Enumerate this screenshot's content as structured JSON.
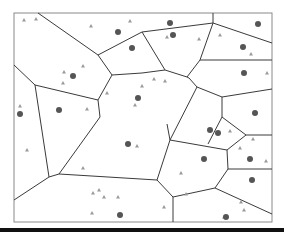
{
  "diagram": {
    "type": "voronoi",
    "frame": {
      "x": 14,
      "y": 13,
      "width": 258,
      "height": 209
    },
    "colors": {
      "edge": "#3a3a3a",
      "frame": "#8a8a8a",
      "site": "#555555",
      "marker": "#9a9a9a",
      "bar": "#111111"
    },
    "edges": [
      [
        38,
        13,
        98,
        55
      ],
      [
        98,
        55,
        112,
        75
      ],
      [
        98,
        55,
        140,
        33
      ],
      [
        140,
        33,
        142,
        32
      ],
      [
        14,
        65,
        35,
        85
      ],
      [
        35,
        85,
        98,
        100
      ],
      [
        98,
        100,
        112,
        75
      ],
      [
        112,
        75,
        142,
        73
      ],
      [
        35,
        85,
        49,
        177
      ],
      [
        49,
        177,
        14,
        200
      ],
      [
        49,
        177,
        59,
        174
      ],
      [
        59,
        174,
        100,
        117
      ],
      [
        100,
        117,
        98,
        100
      ],
      [
        59,
        174,
        157,
        180
      ],
      [
        142,
        32,
        213,
        23
      ],
      [
        213,
        13,
        213,
        23
      ],
      [
        213,
        23,
        272,
        43
      ],
      [
        213,
        23,
        200,
        60
      ],
      [
        200,
        60,
        187,
        77
      ],
      [
        187,
        77,
        165,
        70
      ],
      [
        165,
        70,
        142,
        32
      ],
      [
        187,
        77,
        189,
        78
      ],
      [
        189,
        78,
        197,
        87
      ],
      [
        197,
        87,
        222,
        97
      ],
      [
        222,
        97,
        272,
        89
      ],
      [
        200,
        60,
        272,
        60
      ],
      [
        142,
        73,
        165,
        70
      ],
      [
        197,
        87,
        170,
        140
      ],
      [
        170,
        140,
        167,
        124
      ],
      [
        170,
        140,
        227,
        150
      ],
      [
        227,
        150,
        246,
        135
      ],
      [
        246,
        135,
        272,
        135
      ],
      [
        246,
        135,
        222,
        117
      ],
      [
        222,
        117,
        222,
        97
      ],
      [
        208,
        144,
        222,
        117
      ],
      [
        227,
        150,
        228,
        169
      ],
      [
        228,
        169,
        272,
        169
      ],
      [
        228,
        169,
        215,
        188
      ],
      [
        215,
        188,
        272,
        214
      ],
      [
        215,
        188,
        173,
        197
      ],
      [
        173,
        197,
        173,
        222
      ],
      [
        173,
        197,
        157,
        180
      ],
      [
        157,
        180,
        170,
        140
      ]
    ],
    "sites": [
      [
        118,
        32
      ],
      [
        132,
        48
      ],
      [
        73,
        76
      ],
      [
        138,
        98
      ],
      [
        20,
        114
      ],
      [
        59,
        110
      ],
      [
        128,
        144
      ],
      [
        120,
        215
      ],
      [
        170,
        23
      ],
      [
        173,
        35
      ],
      [
        258,
        24
      ],
      [
        243,
        47
      ],
      [
        244,
        73
      ],
      [
        255,
        113
      ],
      [
        210,
        130
      ],
      [
        218,
        133
      ],
      [
        204,
        159
      ],
      [
        250,
        159
      ],
      [
        252,
        180
      ],
      [
        226,
        217
      ]
    ],
    "markers": [
      [
        24,
        20
      ],
      [
        36,
        19
      ],
      [
        91,
        26
      ],
      [
        130,
        21
      ],
      [
        64,
        72
      ],
      [
        83,
        66
      ],
      [
        63,
        83
      ],
      [
        107,
        93
      ],
      [
        135,
        105
      ],
      [
        20,
        106
      ],
      [
        87,
        109
      ],
      [
        27,
        150
      ],
      [
        83,
        168
      ],
      [
        137,
        146
      ],
      [
        93,
        193
      ],
      [
        99,
        190
      ],
      [
        104,
        197
      ],
      [
        118,
        197
      ],
      [
        92,
        213
      ],
      [
        167,
        37
      ],
      [
        199,
        39
      ],
      [
        220,
        35
      ],
      [
        251,
        54
      ],
      [
        267,
        73
      ],
      [
        154,
        79
      ],
      [
        165,
        81
      ],
      [
        142,
        86
      ],
      [
        230,
        131
      ],
      [
        253,
        139
      ],
      [
        240,
        148
      ],
      [
        266,
        161
      ],
      [
        181,
        173
      ],
      [
        186,
        194
      ],
      [
        164,
        207
      ],
      [
        241,
        202
      ],
      [
        244,
        210
      ],
      [
        224,
        217
      ]
    ]
  }
}
